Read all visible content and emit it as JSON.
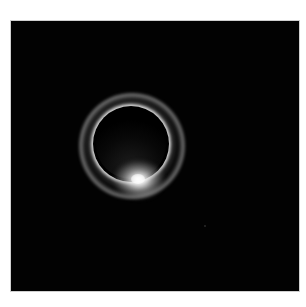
{
  "page": {
    "background_color": "#ffffff",
    "top_text_fragment": ""
  },
  "photo": {
    "subject": "Total solar eclipse with diamond ring effect",
    "background_color": "#020202",
    "border_color": "#cfcfcf",
    "elements": {
      "moon_disk": {
        "color": "#000000"
      },
      "corona_ring": {
        "color": "#f0f0f0"
      },
      "diamond_ring_highlight": {
        "color": "#ffffff",
        "position": "bottom of ring"
      },
      "faint_star": {
        "color": "#2a2a2a"
      }
    }
  }
}
